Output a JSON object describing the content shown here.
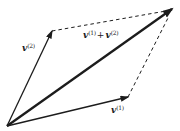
{
  "figure": {
    "background": "#ffffff",
    "ink": "#1c1c1c"
  },
  "geometry": {
    "origin": {
      "x": 7,
      "y": 126
    },
    "v2_tip": {
      "x": 52,
      "y": 31
    },
    "v1_tip": {
      "x": 128,
      "y": 97
    },
    "sum_tip": {
      "x": 172,
      "y": 9
    },
    "dash_top_end": {
      "x": 166,
      "y": 11
    },
    "dash_right_end": {
      "x": 169,
      "y": 16
    }
  },
  "labels": {
    "v2": {
      "base": "v",
      "sup": "(2)"
    },
    "v1": {
      "base": "v",
      "sup": "(1)"
    },
    "sum": {
      "base1": "v",
      "sup1": "(1)",
      "plus": "+",
      "base2": "v",
      "sup2": "(2)"
    }
  }
}
